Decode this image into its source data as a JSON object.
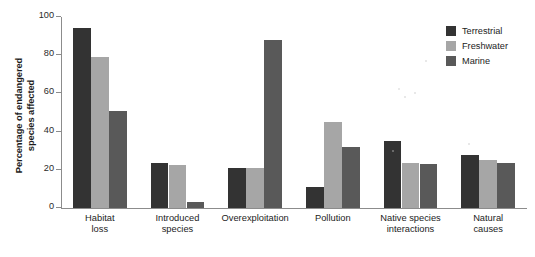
{
  "chart_data": {
    "type": "bar",
    "title": "",
    "xlabel": "",
    "ylabel": "Percentage of endangered\nspecies affected",
    "ylim": [
      0,
      100
    ],
    "yticks": [
      0,
      20,
      40,
      60,
      80,
      100
    ],
    "ytick_labels": [
      "0",
      "20",
      "40",
      "60",
      "80",
      "100"
    ],
    "grid": false,
    "legend_position": "top-right",
    "categories": [
      "Habitat\nloss",
      "Introduced\nspecies",
      "Overexploitation",
      "Pollution",
      "Native species\ninteractions",
      "Natural\ncauses"
    ],
    "series": [
      {
        "name": "Terrestrial",
        "color": "#333333",
        "values": [
          94,
          23.5,
          21,
          11,
          35,
          28
        ]
      },
      {
        "name": "Freshwater",
        "color": "#a6a6a6",
        "values": [
          79,
          22.5,
          21,
          45,
          23.5,
          25
        ]
      },
      {
        "name": "Marine",
        "color": "#595959",
        "values": [
          51,
          3,
          88,
          32,
          23,
          23.5
        ]
      }
    ]
  },
  "axis": {
    "color": "#8c8c8c"
  }
}
